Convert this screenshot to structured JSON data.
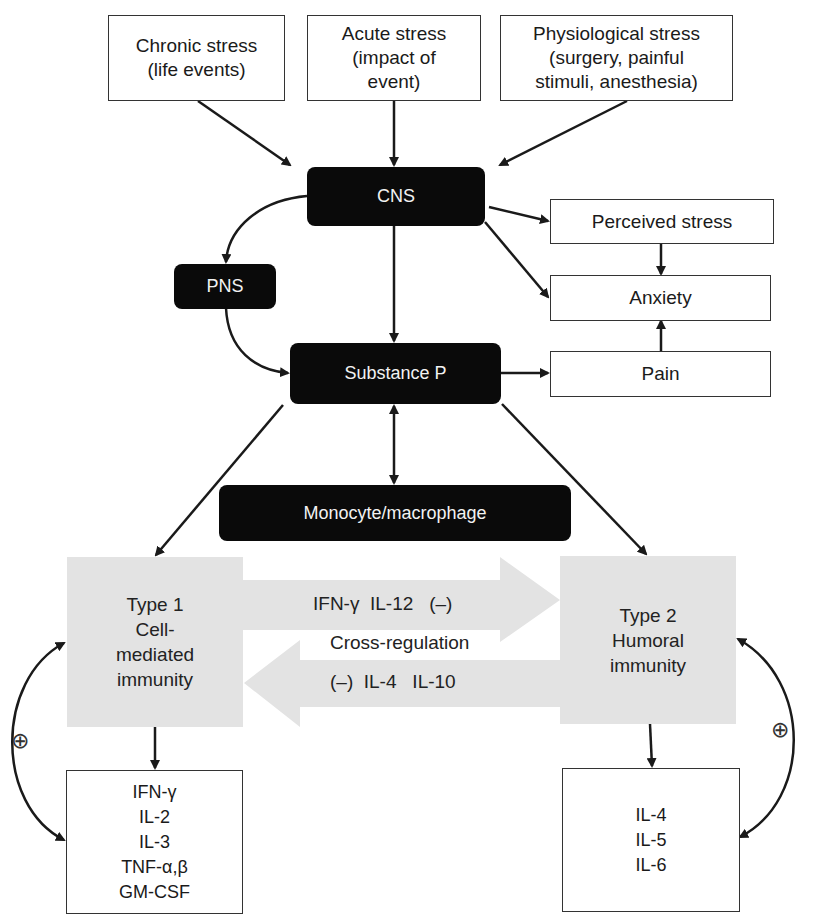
{
  "stressors": [
    {
      "id": "chronic",
      "lines": [
        "Chronic stress",
        "(life events)"
      ]
    },
    {
      "id": "acute",
      "lines": [
        "Acute stress",
        "(impact of",
        "event)"
      ]
    },
    {
      "id": "physiological",
      "lines": [
        "Physiological stress",
        "(surgery, painful",
        "stimuli, anesthesia)"
      ]
    }
  ],
  "nodes": {
    "cns": "CNS",
    "pns": "PNS",
    "substance_p": "Substance P",
    "monocyte": "Monocyte/macrophage"
  },
  "outcomes": {
    "perceived_stress": "Perceived stress",
    "anxiety": "Anxiety",
    "pain": "Pain"
  },
  "type1": {
    "lines": [
      "Type 1",
      "Cell-",
      "mediated",
      "immunity"
    ]
  },
  "type2": {
    "lines": [
      "Type 2",
      "Humoral",
      "immunity"
    ]
  },
  "cross_regulation": {
    "top": "IFN-γ  IL-12   (–)",
    "middle": "Cross-regulation",
    "bottom": "(–)  IL-4   IL-10"
  },
  "type1_cytokines": [
    "IFN-γ",
    "IL-2",
    "IL-3",
    "TNF-α,β",
    "GM-CSF"
  ],
  "type2_cytokines": [
    "IL-4",
    "IL-5",
    "IL-6"
  ],
  "feedback_symbol": "⊕",
  "colors": {
    "dark_node": "#0a0a0a",
    "gray_block": "#e3e3e3",
    "line": "#1a1a1a"
  }
}
